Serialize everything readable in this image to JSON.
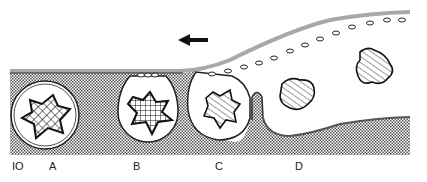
{
  "figure": {
    "number": "IO",
    "stage_labels": [
      "A",
      "B",
      "C",
      "D"
    ],
    "direction_arrow": "left-arrow",
    "colors": {
      "ink": "#111111",
      "membrane": "#a8a8a8",
      "stipple": "#555555",
      "background": "#ffffff"
    }
  },
  "labels": {
    "fig": "IO",
    "a": "A",
    "b": "B",
    "c": "C",
    "d": "D"
  }
}
